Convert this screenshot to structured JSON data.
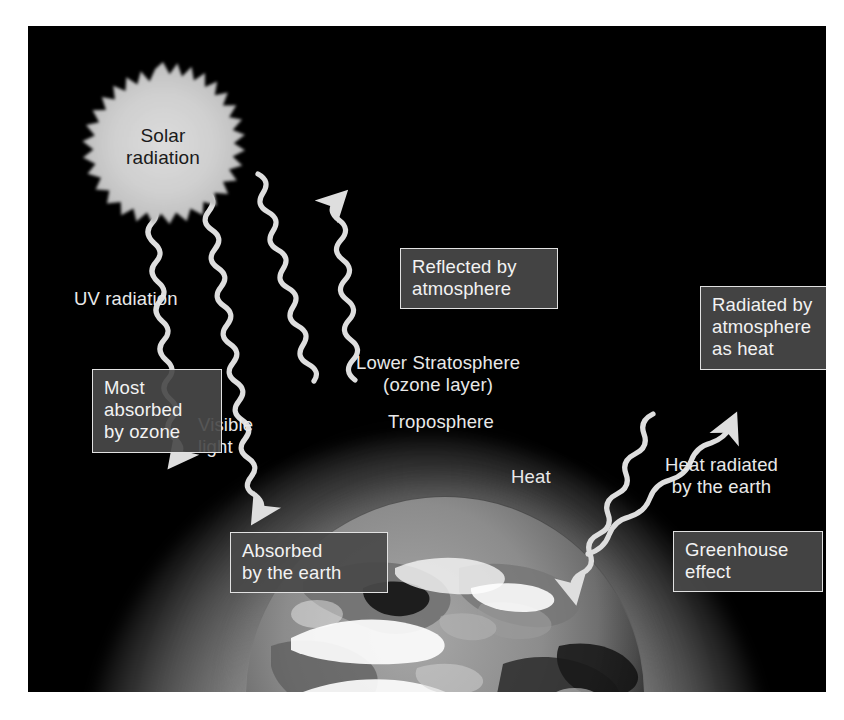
{
  "diagram": {
    "title_text": "Greenhouse effect diagram",
    "sun": {
      "line1": "Solar",
      "line2": "radiation",
      "fill_color": "#c9c9c9",
      "text_color": "#1a1a1a"
    },
    "labels": [
      {
        "id": "uv-radiation",
        "text": "UV radiation",
        "x": 46,
        "y": 262,
        "align": "left"
      },
      {
        "id": "visible-light",
        "text": "Visible\nlight",
        "x": 170,
        "y": 388,
        "align": "left"
      },
      {
        "id": "lower-stratosphere",
        "text": "Lower Stratosphere\n(ozone layer)",
        "x": 328,
        "y": 326,
        "align": "center"
      },
      {
        "id": "troposphere",
        "text": "Troposphere",
        "x": 360,
        "y": 385,
        "align": "center"
      },
      {
        "id": "heat",
        "text": "Heat",
        "x": 483,
        "y": 440,
        "align": "center"
      },
      {
        "id": "heat-radiated",
        "text": "Heat radiated\nby the earth",
        "x": 637,
        "y": 428,
        "align": "center"
      }
    ],
    "boxes": [
      {
        "id": "reflected-by-atmosphere",
        "text": "Reflected by\natmosphere",
        "x": 372,
        "y": 222,
        "w": 134
      },
      {
        "id": "radiated-by-atmosphere",
        "text": "Radiated by\natmosphere\nas heat",
        "x": 672,
        "y": 260,
        "w": 128
      },
      {
        "id": "most-absorbed-by-ozone",
        "text": "Most\nabsorbed\nby ozone",
        "x": 64,
        "y": 343,
        "w": 106
      },
      {
        "id": "absorbed-by-the-earth",
        "text": "Absorbed\nby the earth",
        "x": 202,
        "y": 506,
        "w": 134
      },
      {
        "id": "greenhouse-effect",
        "text": "Greenhouse\neffect",
        "x": 645,
        "y": 505,
        "w": 126
      }
    ],
    "arrows": [
      {
        "id": "ray-uv-absorbed",
        "description": "UV radiation wavy arrow absorbed by ozone"
      },
      {
        "id": "ray-visible-absorbed",
        "description": "Visible light wavy arrow absorbed by the earth"
      },
      {
        "id": "ray-reflected-incoming",
        "description": "Incoming ray reflected by atmosphere"
      },
      {
        "id": "ray-reflected-outgoing",
        "description": "Reflected ray leaving atmosphere upward"
      },
      {
        "id": "ray-heat-radiated-up",
        "description": "Heat radiated by the earth upward out of atmosphere"
      },
      {
        "id": "ray-greenhouse-down",
        "description": "Greenhouse effect heat re-radiated back down to earth"
      }
    ],
    "colors": {
      "background": "#ffffff",
      "sky": "#000000",
      "ray": "#dedede",
      "box_fill": "#494949",
      "box_border": "#e2e2e2",
      "text": "#e9e9e9"
    }
  }
}
